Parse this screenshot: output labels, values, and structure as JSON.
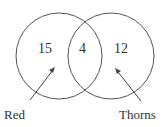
{
  "diagram": {
    "type": "venn",
    "sets": [
      {
        "name": "Red",
        "only": "15",
        "color": "#444444"
      },
      {
        "name": "Thorns",
        "only": "12",
        "color": "#444444"
      }
    ],
    "intersection": "4"
  }
}
